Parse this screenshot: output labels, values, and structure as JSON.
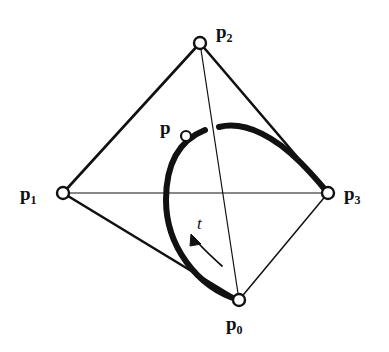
{
  "figure": {
    "type": "geometric-diagram",
    "background_color": "#ffffff",
    "ink_color": "#111111"
  },
  "points": [
    {
      "id": "p0",
      "name": "p",
      "subscript": "0",
      "marker": {
        "cx": 239,
        "cy": 300,
        "r": 6
      },
      "label": {
        "x": 226,
        "y": 314
      }
    },
    {
      "id": "p1",
      "name": "p",
      "subscript": "1",
      "marker": {
        "cx": 63,
        "cy": 193,
        "r": 6
      },
      "label": {
        "x": 20,
        "y": 184
      }
    },
    {
      "id": "p2",
      "name": "p",
      "subscript": "2",
      "marker": {
        "cx": 200,
        "cy": 43,
        "r": 6
      },
      "label": {
        "x": 216,
        "y": 22
      }
    },
    {
      "id": "p3",
      "name": "p",
      "subscript": "3",
      "marker": {
        "cx": 328,
        "cy": 193,
        "r": 6
      },
      "label": {
        "x": 344,
        "y": 184
      }
    },
    {
      "id": "p",
      "name": "p",
      "subscript": "",
      "marker": {
        "cx": 186,
        "cy": 136,
        "r": 5
      },
      "label": {
        "x": 160,
        "y": 118
      }
    }
  ],
  "parameter_label": {
    "text": "t",
    "x": 197,
    "y": 215
  },
  "control_polygon": [
    {
      "from": "p1",
      "to": "p2",
      "width": 2.6,
      "style": "solid"
    },
    {
      "from": "p2",
      "to": "p3",
      "width": 2.6,
      "style": "solid"
    },
    {
      "from": "p1",
      "to": "p0",
      "width": 2.6,
      "style": "solid"
    },
    {
      "from": "p0",
      "to": "p3",
      "width": 1.4,
      "style": "solid"
    },
    {
      "from": "p2",
      "to": "p0",
      "width": 1.2,
      "style": "solid"
    },
    {
      "from": "p1",
      "to": "p3",
      "width": 1.2,
      "style": "solid"
    }
  ],
  "curve": {
    "stroke_width": 6,
    "segments": [
      "M 239 300 C 196 287 166 245 166 200 C 166 162 180 140 205 130",
      "M 219 127 C 247 120 278 140 300 162 C 314 176 322 186 328 193"
    ]
  },
  "direction_arrow": {
    "path": "M 222 266 C 212 257 200 246 193 237",
    "stroke_width": 1.6,
    "arrowhead": "M 193 236 L 200 243 L 189 245 Z"
  }
}
